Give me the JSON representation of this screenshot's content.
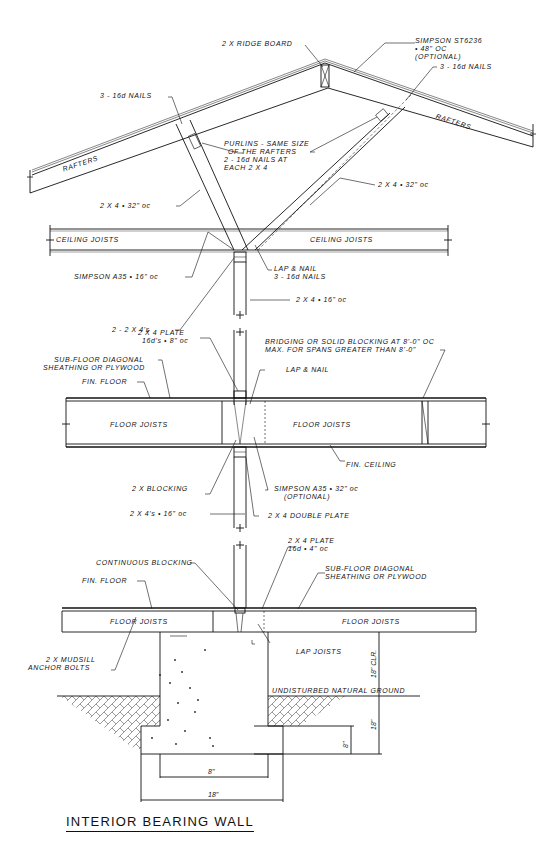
{
  "title": "INTERIOR BEARING WALL",
  "roof": {
    "ridge_board": "2 X RIDGE BOARD",
    "simpson_strap": [
      "SIMPSON ST6236",
      "• 48\" oc",
      "(OPTIONAL)"
    ],
    "nails_right": "3 - 16d NAILS",
    "nails_left": "3 - 16d NAILS",
    "rafters_left": "RAFTERS",
    "rafters_right": "RAFTERS",
    "purlins": [
      "PURLINS - SAME SIZE",
      "OF THE RAFTERS",
      "2 - 16d NAILS AT",
      "EACH 2 X 4"
    ],
    "brace_right": "2 X 4 • 32\" oc",
    "brace_left": "2 X 4 • 32\" oc"
  },
  "ceiling": {
    "joists_left": "CEILING JOISTS",
    "joists_right": "CEILING JOISTS",
    "simpson_a35": "SIMPSON A35 • 16\" oc",
    "lap_nail": [
      "LAP & NAIL",
      "3 - 16d NAILS"
    ],
    "stud": "2 X 4 • 16\" oc",
    "double_stud": "2 - 2 X 4's"
  },
  "second_floor": {
    "plate": [
      "2 X 4 PLATE",
      "16d's • 8\" oc"
    ],
    "bridging": [
      "BRIDGING OR SOLID BLOCKING AT 8'-0\" oc",
      "MAX. FOR SPANS GREATER THAN 8'-0\""
    ],
    "subfloor": [
      "SUB-FLOOR DIAGONAL",
      "SHEATHING or PLYWOOD"
    ],
    "lap_nail": "LAP & NAIL",
    "fin_floor": "FIN. FLOOR",
    "joists_left": "FLOOR JOISTS",
    "joists_right": "FLOOR JOISTS",
    "fin_ceiling": "FIN. CEILING",
    "blocking": "2 X BLOCKING",
    "simpson_a35": [
      "SIMPSON A35 • 32\" oc",
      "(OPTIONAL)"
    ],
    "studs": "2 X 4's • 16\" oc",
    "double_plate": "2 X 4 DOUBLE PLATE"
  },
  "first_floor": {
    "plate": [
      "2 X 4 PLATE",
      "16d • 4\" oc"
    ],
    "continuous_blocking": "CONTINUOUS BLOCKING",
    "subfloor": [
      "SUB-FLOOR DIAGONAL",
      "SHEATHING or PLYWOOD"
    ],
    "fin_floor": "FIN. FLOOR",
    "joists_left": "FLOOR JOISTS",
    "joists_right": "FLOOR JOISTS",
    "lap_joists": "LAP JOISTS",
    "mudsill": [
      "2 X MUDSILL",
      "ANCHOR BOLTS"
    ]
  },
  "foundation": {
    "ground": "UNDISTURBED NATURAL GROUND",
    "clearance": "18\" CLR.",
    "depth": "18\"",
    "footing_height": "8\"",
    "stem_width": "8\"",
    "footing_width": "18\""
  }
}
